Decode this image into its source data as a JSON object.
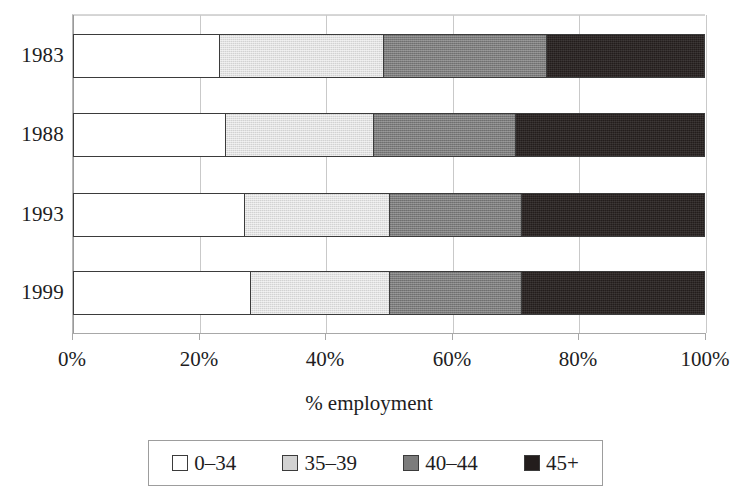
{
  "chart_data": {
    "type": "bar",
    "orientation": "horizontal",
    "stacked": true,
    "normalized": true,
    "title": "",
    "subtitle": "",
    "xlabel": "% employment",
    "ylabel": "",
    "categories": [
      "1983",
      "1988",
      "1993",
      "1999"
    ],
    "series": [
      {
        "name": "0–34",
        "color": "#ffffff",
        "values": [
          23,
          24,
          27,
          28
        ]
      },
      {
        "name": "35–39",
        "color": "#d2d2d2",
        "values": [
          26,
          23.5,
          23,
          22
        ]
      },
      {
        "name": "40–44",
        "color": "#7c7c7c",
        "values": [
          26,
          22.5,
          21,
          21
        ]
      },
      {
        "name": "45+",
        "color": "#231d1c",
        "values": [
          25,
          30,
          29,
          29
        ]
      }
    ],
    "cumulative_boundaries": {
      "1983": [
        23,
        49,
        75,
        100
      ],
      "1988": [
        24,
        47.5,
        70,
        100
      ],
      "1993": [
        27,
        50,
        71,
        100
      ],
      "1999": [
        28,
        50,
        71,
        100
      ]
    },
    "xlim": [
      0,
      100
    ],
    "xticks": [
      0,
      20,
      40,
      60,
      80,
      100
    ],
    "xtick_labels": [
      "0%",
      "20%",
      "40%",
      "60%",
      "80%",
      "100%"
    ],
    "grid": true,
    "grid_axis": "x",
    "legend_position": "bottom",
    "legend_entries": [
      "0–34",
      "35–39",
      "40–44",
      "45+"
    ],
    "value_unit": "%"
  },
  "axis": {
    "x_title": "% employment",
    "tick_labels": [
      "0%",
      "20%",
      "40%",
      "60%",
      "80%",
      "100%"
    ]
  },
  "legend": {
    "items": [
      {
        "label": "0–34",
        "swatch": "white-swatch-icon"
      },
      {
        "label": "35–39",
        "swatch": "light-gray-swatch-icon"
      },
      {
        "label": "40–44",
        "swatch": "mid-gray-swatch-icon"
      },
      {
        "label": "45+",
        "swatch": "black-swatch-icon"
      }
    ]
  }
}
